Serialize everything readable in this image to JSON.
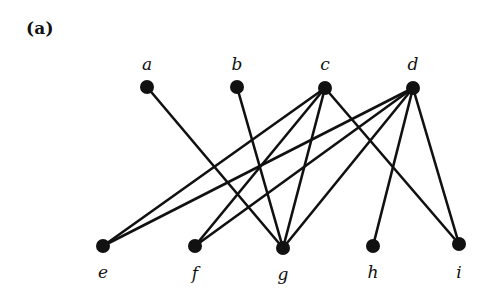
{
  "figure": {
    "panel_label": "(a)",
    "width": 491,
    "height": 299,
    "background_color": "#ffffff",
    "ink_color": "#111111"
  },
  "graph": {
    "type": "bipartite-graph",
    "vertex_radius": 7,
    "edge_width": 2.6,
    "top_row": [
      {
        "id": "a",
        "label": "a",
        "x": 147,
        "y": 87,
        "label_x": 147,
        "label_y": 64
      },
      {
        "id": "b",
        "label": "b",
        "x": 237,
        "y": 87,
        "label_x": 237,
        "label_y": 64
      },
      {
        "id": "c",
        "label": "c",
        "x": 325,
        "y": 88,
        "label_x": 325,
        "label_y": 64
      },
      {
        "id": "d",
        "label": "d",
        "x": 413,
        "y": 88,
        "label_x": 413,
        "label_y": 64
      }
    ],
    "bottom_row": [
      {
        "id": "e",
        "label": "e",
        "x": 103,
        "y": 246,
        "label_x": 103,
        "label_y": 272
      },
      {
        "id": "f",
        "label": "f",
        "x": 195,
        "y": 246,
        "label_x": 195,
        "label_y": 273
      },
      {
        "id": "g",
        "label": "g",
        "x": 283,
        "y": 248,
        "label_x": 283,
        "label_y": 274
      },
      {
        "id": "h",
        "label": "h",
        "x": 373,
        "y": 246,
        "label_x": 373,
        "label_y": 272
      },
      {
        "id": "i",
        "label": "i",
        "x": 459,
        "y": 244,
        "label_x": 459,
        "label_y": 272
      }
    ],
    "edges": [
      {
        "from": "a",
        "to": "g"
      },
      {
        "from": "b",
        "to": "g"
      },
      {
        "from": "c",
        "to": "e"
      },
      {
        "from": "c",
        "to": "f"
      },
      {
        "from": "c",
        "to": "g"
      },
      {
        "from": "c",
        "to": "i"
      },
      {
        "from": "d",
        "to": "e"
      },
      {
        "from": "d",
        "to": "f"
      },
      {
        "from": "d",
        "to": "g"
      },
      {
        "from": "d",
        "to": "h"
      },
      {
        "from": "d",
        "to": "i"
      }
    ]
  }
}
